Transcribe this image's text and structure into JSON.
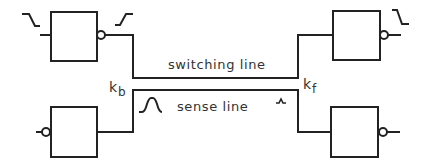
{
  "diagram": {
    "labels": {
      "switching_line": "switching line",
      "sense_line": "sense line",
      "k_b_main": "k",
      "k_b_sub": "b",
      "k_f_main": "k",
      "k_f_sub": "f"
    },
    "gates": [
      {
        "id": "top-left",
        "type": "inverter",
        "bubble": "output",
        "input_waveform": "falling-edge",
        "output_waveform": "rising-edge"
      },
      {
        "id": "top-right",
        "type": "inverter",
        "bubble": "output",
        "output_waveform": "falling-edge"
      },
      {
        "id": "bottom-left",
        "type": "receiver",
        "bubble": "input"
      },
      {
        "id": "bottom-right",
        "type": "inverter",
        "bubble": "output"
      }
    ],
    "waveforms": {
      "sense_near_end": "pulse-large",
      "sense_far_end": "pulse-small"
    },
    "colors": {
      "stroke": "#222222",
      "text": "#333333",
      "background": "#ffffff"
    }
  }
}
